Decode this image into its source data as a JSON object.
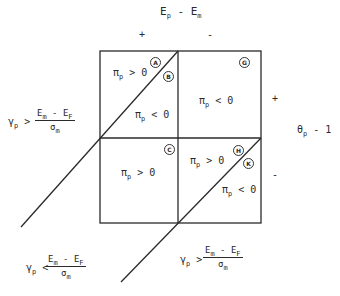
{
  "axes": {
    "top_label": {
      "base": "E",
      "sub": "p",
      "op": "-",
      "base2": "E",
      "sub2": "m"
    },
    "top_plus": "+",
    "top_minus": "-",
    "right_label": {
      "base": "θ",
      "sub": "p",
      "rest": "- 1"
    },
    "right_plus": "+",
    "right_minus": "-"
  },
  "regions": {
    "A": {
      "letter": "A"
    },
    "B": {
      "letter": "B"
    },
    "G": {
      "letter": "G"
    },
    "C": {
      "letter": "C"
    },
    "H": {
      "letter": "H"
    },
    "K": {
      "letter": "K"
    }
  },
  "region_texts": {
    "ul_upper": {
      "sym": "π",
      "sub": "p",
      "rel": "> 0"
    },
    "ul_lower": {
      "sym": "π",
      "sub": "p",
      "rel": "< 0"
    },
    "ur": {
      "sym": "π",
      "sub": "p",
      "rel": "< 0"
    },
    "ll": {
      "sym": "π",
      "sub": "p",
      "rel": "> 0"
    },
    "lr_upper": {
      "sym": "π",
      "sub": "p",
      "rel": "> 0"
    },
    "lr_lower": {
      "sym": "π",
      "sub": "p",
      "rel": "< 0"
    }
  },
  "conditions": {
    "left_upper": {
      "lhs": "γ",
      "lhs_sub": "p",
      "rel": ">",
      "num": "E",
      "num_sub": "m",
      "num_op": "-",
      "num2": "E",
      "num2_sub": "F",
      "den": "σ",
      "den_sub": "m"
    },
    "left_lower": {
      "lhs": "γ",
      "lhs_sub": "p",
      "rel": "<",
      "num": "E",
      "num_sub": "m",
      "num_op": "-",
      "num2": "E",
      "num2_sub": "F",
      "den": "σ",
      "den_sub": "m"
    },
    "bottom_right": {
      "lhs": "γ",
      "lhs_sub": "p",
      "rel": ">",
      "num": "E",
      "num_sub": "m",
      "num_op": "-",
      "num2": "E",
      "num2_sub": "F",
      "den": "σ",
      "den_sub": "m"
    }
  },
  "colors": {
    "ink": "#2a2a2a",
    "background": "#ffffff"
  }
}
